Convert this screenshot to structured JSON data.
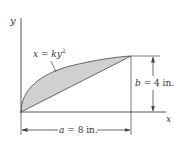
{
  "figure": {
    "axes": {
      "x_label": "x",
      "y_label": "y"
    },
    "curve": {
      "equation_lhs": "x = k",
      "equation_var": "y",
      "equation_exp": "2"
    },
    "dimensions": {
      "width": {
        "symbol": "a",
        "text": " = 8 in."
      },
      "height": {
        "symbol": "b",
        "text": " = 4 in."
      }
    },
    "colors": {
      "fill": "#d0d0d0",
      "stroke": "#444444",
      "text": "#333333"
    }
  }
}
